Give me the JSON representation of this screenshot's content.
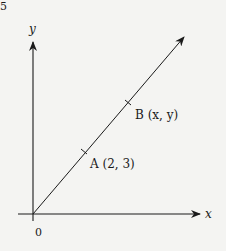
{
  "figure": {
    "corner_fragment": "5",
    "axes": {
      "x_label": "x",
      "y_label": "y",
      "origin_label": "0"
    },
    "points": [
      {
        "name": "A",
        "coords": "(2, 3)",
        "label": "A (2, 3)"
      },
      {
        "name": "B",
        "coords": "(x, y)",
        "label": "B (x, y)"
      }
    ],
    "colors": {
      "ink": "#1a1a1a",
      "background": "#f4f4f2"
    }
  }
}
